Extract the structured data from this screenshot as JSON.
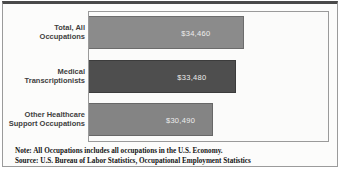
{
  "figure": {
    "note_line1": "Note: All Occupations includes all occupations in the U.S. Economy.",
    "note_line2": "Source: U.S. Bureau of Labor Statistics, Occupational Employment Statistics"
  },
  "chart_data": {
    "type": "bar",
    "orientation": "horizontal",
    "categories": [
      "Total, All Occupations",
      "Medical Transcriptionists",
      "Other Healthcare Support Occupations"
    ],
    "values": [
      34460,
      33480,
      30490
    ],
    "value_labels": [
      "$34,460",
      "$33,480",
      "$30,490"
    ],
    "bar_colors": [
      "#8b8b8b",
      "#4e4e4e",
      "#848484"
    ],
    "bar_width_pct": [
      64.7,
      61.4,
      51.9
    ],
    "bar_tops_px": [
      4,
      48,
      91
    ],
    "value_label_color": "#ededed",
    "axes_visible": false,
    "grid": false,
    "legend": null,
    "xlim": [
      0,
      50000
    ]
  }
}
